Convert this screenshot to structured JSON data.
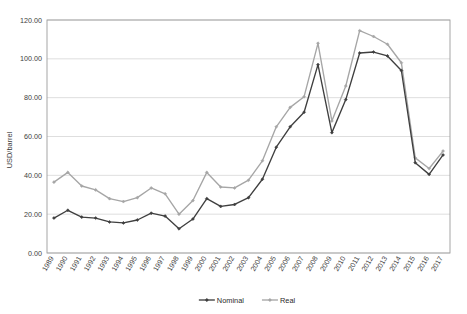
{
  "chart_data": {
    "type": "line",
    "title": "",
    "xlabel": "",
    "ylabel": "USD/barrel",
    "ylim": [
      0,
      120
    ],
    "ytick_step": 20,
    "ytick_labels": [
      "0.00",
      "20.00",
      "40.00",
      "60.00",
      "80.00",
      "100.00",
      "120.00"
    ],
    "grid": true,
    "legend_position": "bottom",
    "categories": [
      "1989",
      "1990",
      "1991",
      "1992",
      "1993",
      "1994",
      "1995",
      "1996",
      "1997",
      "1998",
      "1999",
      "2000",
      "2001",
      "2002",
      "2003",
      "2004",
      "2005",
      "2006",
      "2007",
      "2008",
      "2009",
      "2010",
      "2011",
      "2012",
      "2013",
      "2014",
      "2015",
      "2016",
      "2017"
    ],
    "series": [
      {
        "name": "Nominal",
        "color": "#3f3f3f",
        "marker": "diamond",
        "values": [
          18.0,
          22.0,
          18.5,
          18.0,
          16.0,
          15.5,
          17.0,
          20.5,
          19.0,
          12.5,
          17.5,
          28.0,
          24.0,
          25.0,
          28.5,
          38.0,
          54.5,
          65.0,
          72.5,
          97.0,
          62.0,
          79.0,
          103.0,
          103.5,
          101.5,
          94.0,
          46.5,
          40.5,
          50.5
        ]
      },
      {
        "name": "Real",
        "color": "#a6a6a6",
        "marker": "diamond",
        "values": [
          36.5,
          41.5,
          34.5,
          32.5,
          28.0,
          26.5,
          28.5,
          33.5,
          30.5,
          20.0,
          27.0,
          41.5,
          34.0,
          33.5,
          37.5,
          47.5,
          65.0,
          75.0,
          80.5,
          108.0,
          68.0,
          86.0,
          114.5,
          111.5,
          107.5,
          98.0,
          49.0,
          43.5,
          52.5
        ]
      }
    ]
  },
  "legend": {
    "items": [
      {
        "label": "Nominal",
        "color": "#3f3f3f"
      },
      {
        "label": "Real",
        "color": "#a6a6a6"
      }
    ]
  },
  "axes": {
    "y_title": "USD/barrel"
  }
}
